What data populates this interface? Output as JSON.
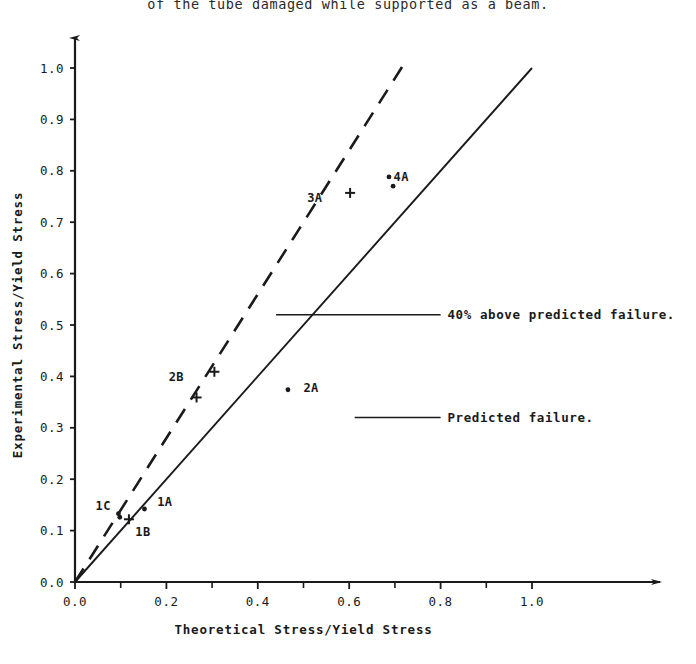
{
  "caption": {
    "text": "of the tube damaged while supported as a beam."
  },
  "chart_data": {
    "type": "scatter",
    "title": "",
    "xlabel": "Theoretical Stress/Yield Stress",
    "ylabel": "Experimental Stress/Yield Stress",
    "xlim": [
      0.0,
      1.0
    ],
    "ylim": [
      0.0,
      1.0
    ],
    "grid": false,
    "legend": "none",
    "xticks": [
      0.0,
      0.2,
      0.4,
      0.6,
      0.8,
      1.0
    ],
    "xtick_labels": [
      "0.0",
      "0.2",
      "0.4",
      "0.6",
      "0.8",
      "1.0"
    ],
    "xminor_ticks": [
      0.1,
      0.3,
      0.5,
      0.7,
      0.9
    ],
    "yticks": [
      0.0,
      0.1,
      0.2,
      0.3,
      0.4,
      0.5,
      0.6,
      0.7,
      0.8,
      0.9,
      1.0
    ],
    "ytick_labels": [
      "0.0",
      "0.1",
      "0.2",
      "0.3",
      "0.4",
      "0.5",
      "0.6",
      "0.7",
      "0.8",
      "0.9",
      "1.0"
    ],
    "reference_lines": [
      {
        "name": "predicted-failure-line",
        "style": "solid",
        "slope": 1.0,
        "intercept": 0.0,
        "x_from": 0.0,
        "x_to": 1.0,
        "label": "Predicted failure."
      },
      {
        "name": "forty-percent-above-line",
        "style": "dashed",
        "slope": 1.4,
        "intercept": 0.0,
        "x_from": 0.0,
        "x_to": 0.72,
        "label": "40% above predicted failure."
      }
    ],
    "annotations": [
      {
        "name": "annot-40-percent",
        "text": "40% above predicted failure.",
        "leader_from": [
          0.44,
          0.52
        ],
        "leader_to": [
          0.8,
          0.52
        ],
        "text_x": 0.815,
        "text_y": 0.52
      },
      {
        "name": "annot-predicted",
        "text": "Predicted failure.",
        "leader_from": [
          0.612,
          0.32
        ],
        "leader_to": [
          0.8,
          0.32
        ],
        "text_x": 0.815,
        "text_y": 0.32
      }
    ],
    "series": [
      {
        "name": "1A",
        "marker": "dot",
        "label_x": 0.18,
        "label_y": 0.155,
        "points": [
          [
            0.152,
            0.142
          ]
        ]
      },
      {
        "name": "1B",
        "marker": "plus",
        "label_x": 0.132,
        "label_y": 0.098,
        "points": [
          [
            0.118,
            0.122
          ]
        ]
      },
      {
        "name": "1C",
        "marker": "dot",
        "label_x": 0.045,
        "label_y": 0.148,
        "points": [
          [
            0.095,
            0.133
          ],
          [
            0.098,
            0.126
          ]
        ]
      },
      {
        "name": "2A",
        "marker": "dot",
        "label_x": 0.5,
        "label_y": 0.378,
        "points": [
          [
            0.466,
            0.374
          ]
        ]
      },
      {
        "name": "2B",
        "marker": "plus",
        "label_x": 0.205,
        "label_y": 0.398,
        "points": [
          [
            0.305,
            0.409
          ],
          [
            0.266,
            0.359
          ]
        ]
      },
      {
        "name": "3A",
        "marker": "plus",
        "label_x": 0.508,
        "label_y": 0.748,
        "points": [
          [
            0.602,
            0.757
          ]
        ]
      },
      {
        "name": "4A",
        "marker": "dot",
        "label_x": 0.697,
        "label_y": 0.788,
        "points": [
          [
            0.687,
            0.788
          ],
          [
            0.696,
            0.77
          ]
        ]
      }
    ]
  }
}
